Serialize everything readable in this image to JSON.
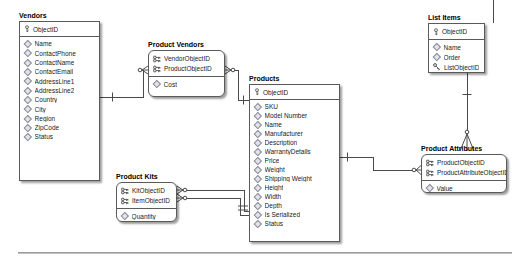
{
  "tables": [
    {
      "name": "Vendors",
      "keys": [
        "ObjectID"
      ],
      "fields": [
        "Name",
        "ContactPhone",
        "ContactName",
        "ContactEmail",
        "AddressLine1",
        "AddressLine2",
        "Country",
        "City",
        "Region",
        "ZipCode",
        "Status"
      ]
    },
    {
      "name": "Product Vendors",
      "keys": [
        "VendorObjectID",
        "ProductObjectID"
      ],
      "fields": [
        "Cost"
      ]
    },
    {
      "name": "Products",
      "keys": [
        "ObjectID"
      ],
      "fields": [
        "SKU",
        "Model Number",
        "Name",
        "Manufacturer",
        "Description",
        "WarrantyDetails",
        "Price",
        "Weight",
        "Shipping Weight",
        "Height",
        "Width",
        "Depth",
        "Is Serialized",
        "Status"
      ]
    },
    {
      "name": "Product Kits",
      "keys": [
        "KitObjectID",
        "ItemObjectID"
      ],
      "fields": [
        "Quantity"
      ]
    },
    {
      "name": "List Items",
      "keys": [
        "ObjectID"
      ],
      "fields": [
        "Name",
        "Order",
        "ListObjectID"
      ]
    },
    {
      "name": "Product Attributes",
      "keys": [
        "ProductObjectID",
        "ProductAttributeObjectID"
      ],
      "fields": [
        "Value"
      ]
    }
  ],
  "relationships": [
    {
      "from": "Vendors",
      "to": "Product Vendors",
      "from_end": "one",
      "to_end": "many"
    },
    {
      "from": "Products",
      "to": "Product Vendors",
      "from_end": "one",
      "to_end": "zero-or-many"
    },
    {
      "from": "Products",
      "to": "Product Kits",
      "via": "KitObjectID",
      "from_end": "one",
      "to_end": "zero-or-many"
    },
    {
      "from": "Products",
      "to": "Product Kits",
      "via": "ItemObjectID",
      "from_end": "one",
      "to_end": "zero-or-many"
    },
    {
      "from": "Products",
      "to": "Product Attributes",
      "from_end": "one",
      "to_end": "zero-or-many"
    },
    {
      "from": "List Items",
      "to": "Product Attributes",
      "from_end": "one",
      "to_end": "zero-or-many"
    }
  ],
  "colors": {
    "box_border": "#5a5a5a",
    "box_background": "#ffffff",
    "connector_line": "#4a4a4a",
    "text": "#1a1a1a",
    "separator": "#969696"
  }
}
